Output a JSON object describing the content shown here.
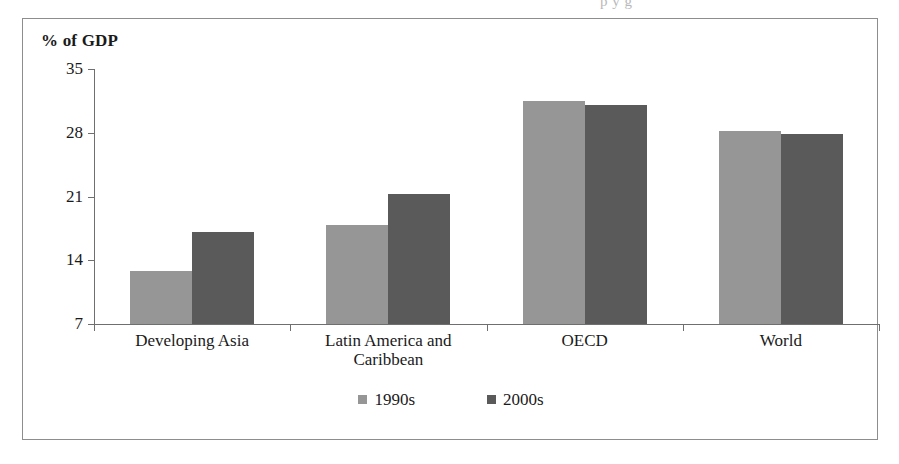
{
  "figure": {
    "bleed_text": "p   y   g",
    "axis_title": "% of GDP"
  },
  "chart_data": {
    "type": "bar",
    "title": "",
    "xlabel": "",
    "ylabel": "% of GDP",
    "ylim": [
      7,
      35
    ],
    "yticks": [
      7,
      14,
      21,
      28,
      35
    ],
    "ytick_labels": [
      "7",
      "14",
      "21",
      "28",
      "35"
    ],
    "grid": false,
    "legend_position": "bottom",
    "categories": [
      "Developing Asia",
      "Latin America and\nCaribbean",
      "OECD",
      "World"
    ],
    "series": [
      {
        "name": "1990s",
        "color": "#969696",
        "values": [
          12.8,
          17.9,
          31.5,
          28.2
        ]
      },
      {
        "name": "2000s",
        "color": "#5a5a5a",
        "values": [
          17.1,
          21.3,
          31.1,
          27.9
        ]
      }
    ]
  }
}
